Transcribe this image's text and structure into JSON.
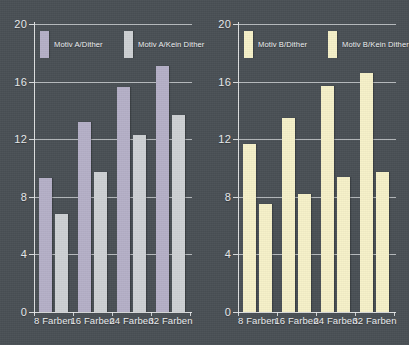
{
  "figure": {
    "background_color": "#4a5055",
    "axis_color": "#e8eaec",
    "grid_color": "#dfe2e5",
    "text_color": "#eceef0"
  },
  "chart_data": [
    {
      "type": "bar",
      "title": "",
      "xlabel": "",
      "ylabel": "",
      "categories": [
        "8 Farben",
        "16 Farben",
        "24 Farben",
        "32 Farben"
      ],
      "series": [
        {
          "name": "Motiv A/Dither",
          "color": "#b5b0c8",
          "values": [
            9.3,
            13.2,
            15.6,
            17.1
          ]
        },
        {
          "name": "Motiv A/Kein Dither",
          "color": "#ced1d4",
          "values": [
            6.8,
            9.7,
            12.3,
            13.7
          ]
        }
      ],
      "ylim": [
        0,
        20
      ],
      "yticks": [
        0,
        4,
        8,
        12,
        16,
        20
      ],
      "grid": true,
      "legend_position": "top-inside"
    },
    {
      "type": "bar",
      "title": "",
      "xlabel": "",
      "ylabel": "",
      "categories": [
        "8 Farben",
        "16 Farben",
        "24 Farben",
        "32 Farben"
      ],
      "series": [
        {
          "name": "Motiv B/Dither",
          "color": "#f6f1c9",
          "values": [
            11.7,
            13.5,
            15.7,
            16.6
          ]
        },
        {
          "name": "Motiv B/Kein Dither",
          "color": "#f6f1c9",
          "values": [
            7.5,
            8.2,
            9.4,
            9.7
          ]
        }
      ],
      "ylim": [
        0,
        20
      ],
      "yticks": [
        0,
        4,
        8,
        12,
        16,
        20
      ],
      "grid": true,
      "legend_position": "top-inside"
    }
  ]
}
